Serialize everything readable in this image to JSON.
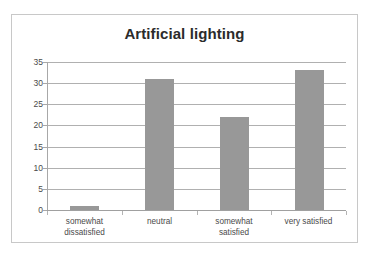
{
  "chart_data": {
    "type": "bar",
    "title": "Artificial lighting",
    "xlabel": "",
    "ylabel": "",
    "categories": [
      "somewhat dissatisfied",
      "neutral",
      "somewhat satisfied",
      "very satisfied"
    ],
    "values": [
      1,
      31,
      22,
      33
    ],
    "ylim": [
      0,
      35
    ],
    "ytick_labels": [
      "0",
      "5",
      "10",
      "15",
      "20",
      "25",
      "30",
      "35"
    ],
    "ytick_values": [
      0,
      5,
      10,
      15,
      20,
      25,
      30,
      35
    ],
    "grid": "horizontal",
    "legend": "none",
    "bar_color": "#989898",
    "gridline_color": "#b0b0b0",
    "axis_color": "#a8a8a8",
    "text_color": "#4a4a4a",
    "title_color": "#2b2b2b",
    "background_color": "#ffffff",
    "border_color": "#c8c8c8",
    "series": [
      {
        "name": "Artificial lighting",
        "values": [
          1,
          31,
          22,
          33
        ]
      }
    ]
  },
  "category_lines": [
    [
      "somewhat",
      "dissatisfied"
    ],
    [
      "neutral",
      ""
    ],
    [
      "somewhat",
      "satisfied"
    ],
    [
      "very satisfied",
      ""
    ]
  ]
}
